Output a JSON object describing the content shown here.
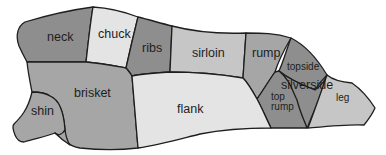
{
  "colors": {
    "dark": "#8e8e8e",
    "medium": "#a6a6a6",
    "light": "#c6c6c6",
    "lightest": "#e4e4e4",
    "outline": "#1e1e1e"
  },
  "cuts": {
    "neck": {
      "label": "neck",
      "shade": "dark"
    },
    "chuck": {
      "label": "chuck",
      "shade": "lightest"
    },
    "ribs": {
      "label": "ribs",
      "shade": "dark"
    },
    "sirloin": {
      "label": "sirloin",
      "shade": "light"
    },
    "rump": {
      "label": "rump",
      "shade": "medium"
    },
    "topside": {
      "label": "topside",
      "shade": "dark"
    },
    "silverside": {
      "label": "silverside",
      "shade": "dark"
    },
    "top_rump": {
      "label_line1": "top",
      "label_line2": "rump",
      "shade": "dark"
    },
    "leg": {
      "label": "leg",
      "shade": "light"
    },
    "brisket": {
      "label": "brisket",
      "shade": "medium"
    },
    "shin": {
      "label": "shin",
      "shade": "medium"
    },
    "flank": {
      "label": "flank",
      "shade": "lightest"
    }
  }
}
